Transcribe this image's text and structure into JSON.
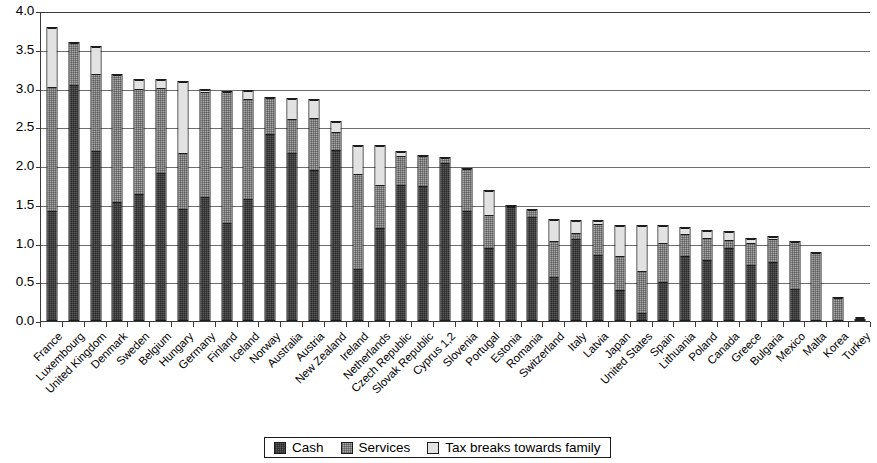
{
  "chart_data": {
    "type": "bar",
    "stacked": true,
    "title": "",
    "xlabel": "",
    "ylabel": "",
    "ylim": [
      0.0,
      4.0
    ],
    "ytick_labels": [
      "0.0",
      "0.5",
      "1.0",
      "1.5",
      "2.0",
      "2.5",
      "3.0",
      "3.5",
      "4.0"
    ],
    "ytick_values": [
      0.0,
      0.5,
      1.0,
      1.5,
      2.0,
      2.5,
      3.0,
      3.5,
      4.0
    ],
    "grid": true,
    "legend_position": "bottom",
    "categories": [
      "France",
      "Luxembourg",
      "United Kingdom",
      "Denmark",
      "Sweden",
      "Belgium",
      "Hungary",
      "Germany",
      "Finland",
      "Iceland",
      "Norway",
      "Australia",
      "Austria",
      "New Zealand",
      "Ireland",
      "Netherlands",
      "Czech Republic",
      "Slovak Republic",
      "Cyprus 1,2",
      "Slovenia",
      "Portugal",
      "Estonia",
      "Romania",
      "Switzerland",
      "Italy",
      "Latvia",
      "Japan",
      "United States",
      "Spain",
      "Lithuania",
      "Poland",
      "Canada",
      "Greece",
      "Bulgaria",
      "Mexico",
      "Malta",
      "Korea",
      "Turkey"
    ],
    "series": [
      {
        "name": "Cash",
        "color": "#595959",
        "values": [
          1.41,
          3.05,
          2.2,
          1.53,
          1.64,
          1.91,
          1.45,
          1.6,
          1.26,
          1.58,
          2.42,
          2.17,
          1.95,
          2.21,
          0.67,
          1.2,
          1.76,
          1.75,
          2.05,
          1.43,
          0.95,
          1.48,
          1.35,
          0.57,
          1.07,
          0.85,
          0.4,
          0.09,
          0.5,
          0.84,
          0.79,
          0.95,
          0.73,
          0.77,
          0.41,
          0.0,
          0.0,
          0.01
        ]
      },
      {
        "name": "Services",
        "color": "#a8a8a8",
        "values": [
          1.62,
          0.55,
          1.0,
          1.66,
          1.36,
          1.11,
          0.72,
          1.37,
          1.71,
          1.3,
          0.47,
          0.45,
          0.68,
          0.24,
          1.24,
          0.56,
          0.38,
          0.39,
          0.07,
          0.55,
          0.42,
          0.02,
          0.09,
          0.47,
          0.07,
          0.42,
          0.45,
          0.55,
          0.51,
          0.29,
          0.29,
          0.11,
          0.29,
          0.3,
          0.62,
          0.89,
          0.31,
          0.01
        ]
      },
      {
        "name": "Tax breaks towards family",
        "color": "#e2e2e2",
        "values": [
          0.76,
          0.0,
          0.35,
          0.0,
          0.12,
          0.1,
          0.93,
          0.02,
          0.0,
          0.1,
          0.0,
          0.26,
          0.23,
          0.13,
          0.36,
          0.51,
          0.05,
          0.0,
          0.0,
          0.0,
          0.32,
          0.0,
          0.0,
          0.27,
          0.16,
          0.03,
          0.39,
          0.6,
          0.23,
          0.08,
          0.09,
          0.1,
          0.05,
          0.03,
          0.0,
          0.0,
          0.0,
          0.01
        ]
      }
    ],
    "totals": [
      3.79,
      3.6,
      3.55,
      3.19,
      3.12,
      3.12,
      3.1,
      2.99,
      2.97,
      2.98,
      2.89,
      2.88,
      2.86,
      2.58,
      2.27,
      2.27,
      2.19,
      2.14,
      2.12,
      1.98,
      1.69,
      1.5,
      1.44,
      1.31,
      1.3,
      1.3,
      1.24,
      1.24,
      1.24,
      1.21,
      1.17,
      1.16,
      1.07,
      1.1,
      1.03,
      0.89,
      0.31,
      0.03
    ]
  },
  "legend": {
    "items": [
      {
        "label": "Cash",
        "swatch": "cash-swatch"
      },
      {
        "label": "Services",
        "swatch": "services-swatch"
      },
      {
        "label": "Tax breaks towards family",
        "swatch": "tax-breaks-swatch"
      }
    ]
  }
}
